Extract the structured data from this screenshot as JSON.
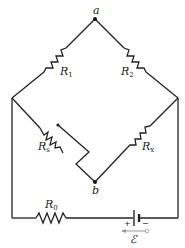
{
  "diagram": {
    "type": "wheatstone-bridge-circuit",
    "nodes": {
      "a": {
        "label": "a"
      },
      "b": {
        "label": "b"
      }
    },
    "resistors": {
      "r1": {
        "label": "R",
        "sub": "1"
      },
      "r2": {
        "label": "R",
        "sub": "2"
      },
      "rs": {
        "label": "R",
        "sub": "s"
      },
      "rx": {
        "label": "R",
        "sub": "x"
      },
      "r0": {
        "label": "R",
        "sub": "0"
      }
    },
    "battery": {
      "label": "ℰ",
      "plus": "+",
      "minus": "−"
    },
    "colors": {
      "line": "#222222",
      "arrow": "#999999",
      "background": "#ffffff"
    }
  }
}
